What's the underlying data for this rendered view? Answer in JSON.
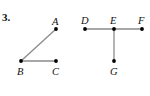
{
  "problem_number": "3.",
  "colors": {
    "edge": "#8a8a8a",
    "point": "#000000",
    "text": "#111111"
  },
  "figures": [
    {
      "name": "angle-ABC",
      "points": {
        "A": {
          "label": "A",
          "x": 56,
          "y": 29
        },
        "B": {
          "label": "B",
          "x": 21,
          "y": 61
        },
        "C": {
          "label": "C",
          "x": 56,
          "y": 61
        }
      },
      "edges": [
        [
          "B",
          "A"
        ],
        [
          "B",
          "C"
        ]
      ]
    },
    {
      "name": "figure-DEFG",
      "points": {
        "D": {
          "label": "D",
          "x": 85,
          "y": 29
        },
        "E": {
          "label": "E",
          "x": 114,
          "y": 29
        },
        "F": {
          "label": "F",
          "x": 142,
          "y": 29
        },
        "G": {
          "label": "G",
          "x": 114,
          "y": 61
        }
      },
      "edges": [
        [
          "D",
          "F"
        ],
        [
          "E",
          "G"
        ]
      ]
    }
  ]
}
